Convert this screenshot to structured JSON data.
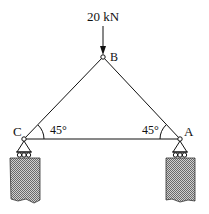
{
  "diagram": {
    "type": "truss",
    "load": {
      "label": "20 kN",
      "direction": "down",
      "node": "B"
    },
    "nodes": {
      "A": {
        "label": "A",
        "support": "roller"
      },
      "B": {
        "label": "B"
      },
      "C": {
        "label": "C",
        "support": "roller"
      }
    },
    "angles": {
      "at_C": "45°",
      "at_A": "45°"
    },
    "members": [
      "CB",
      "BA",
      "CA"
    ],
    "colors": {
      "line": "#111111",
      "hatch": "#888888",
      "background": "#ffffff"
    }
  }
}
